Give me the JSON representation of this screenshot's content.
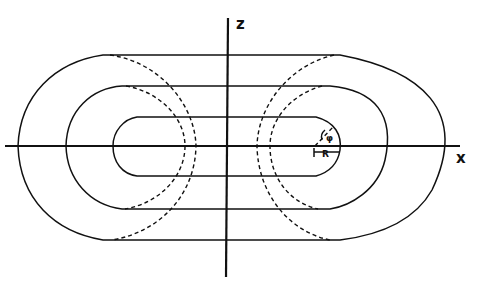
{
  "diagram": {
    "axes": {
      "horizontal_label": "x",
      "vertical_label": "z"
    },
    "annotations": {
      "radius_label": "R",
      "angle_label": "φ"
    },
    "surfaces": [
      {
        "name": "inner",
        "style": "solid"
      },
      {
        "name": "middle",
        "style": "solid"
      },
      {
        "name": "outer",
        "style": "solid"
      }
    ],
    "dashed_arcs": [
      {
        "name": "left-inner-dashed"
      },
      {
        "name": "left-outer-dashed"
      },
      {
        "name": "right-inner-dashed"
      },
      {
        "name": "right-outer-dashed"
      }
    ]
  }
}
